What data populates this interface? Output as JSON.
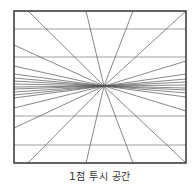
{
  "caption": "1점 투시 공간",
  "colors": {
    "frame": "#333333",
    "line": "#555555",
    "background": "#ffffff"
  },
  "frame": {
    "x": 14,
    "y": 11,
    "width": 172,
    "height": 152
  },
  "vanishing_point": {
    "x": 104,
    "y": 86
  },
  "horizontal_lines_y": [
    29,
    57,
    116,
    145
  ],
  "rays_to": [
    [
      28,
      11
    ],
    [
      86,
      11
    ],
    [
      133,
      11
    ],
    [
      186,
      11
    ],
    [
      28,
      163
    ],
    [
      86,
      163
    ],
    [
      133,
      163
    ],
    [
      186,
      163
    ],
    [
      14,
      45
    ],
    [
      14,
      66
    ],
    [
      14,
      74
    ],
    [
      14,
      78
    ],
    [
      14,
      81
    ],
    [
      14,
      84
    ],
    [
      14,
      87
    ],
    [
      14,
      89
    ],
    [
      14,
      92
    ],
    [
      14,
      95
    ],
    [
      14,
      98
    ],
    [
      14,
      108
    ],
    [
      14,
      128
    ],
    [
      186,
      61
    ],
    [
      186,
      74
    ],
    [
      186,
      79
    ],
    [
      186,
      82
    ],
    [
      186,
      85
    ],
    [
      186,
      88
    ],
    [
      186,
      90
    ],
    [
      186,
      93
    ],
    [
      186,
      97
    ],
    [
      186,
      111
    ]
  ]
}
